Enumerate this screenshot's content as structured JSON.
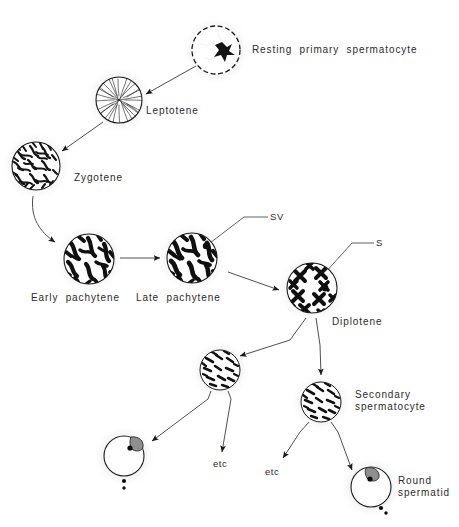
{
  "diagram": {
    "background_color": "#ffffff",
    "ink_color": "#1a1a1a",
    "text_color": "#2b2b2b",
    "halo_color": "#e8e8e8"
  },
  "labels": {
    "resting_primary_spermatocyte": "Resting  primary  spermatocyte",
    "leptotene": "Leptotene",
    "zygotene": "Zygotene",
    "early_pachytene": "Early  pachytene",
    "late_pachytene": "Late  pachytene",
    "diplotene": "Diplotene",
    "secondary_spermatocyte_line1": "Secondary",
    "secondary_spermatocyte_line2": "spermatocyte",
    "round_spermatid_line1": "Round",
    "round_spermatid_line2": "spermatid",
    "sv": "SV",
    "s": "S",
    "etc_left": "etc",
    "etc_right": "etc"
  },
  "cells": [
    {
      "id": "resting-primary-spermatocyte",
      "name": "resting-primary-spermatocyte-cell",
      "cx": 216,
      "cy": 50,
      "r": 25,
      "style": "dashed-outline-with-nucleolus"
    },
    {
      "id": "leptotene",
      "name": "leptotene-cell",
      "cx": 119,
      "cy": 100,
      "r": 24,
      "style": "fine-radiating-threads"
    },
    {
      "id": "zygotene",
      "name": "zygotene-cell",
      "cx": 36,
      "cy": 166,
      "r": 25,
      "style": "dense-squiggle-chromatin"
    },
    {
      "id": "early-pachytene",
      "name": "early-pachytene-cell",
      "cx": 89,
      "cy": 259,
      "r": 26,
      "style": "thick-chromosome-bars"
    },
    {
      "id": "late-pachytene",
      "name": "late-pachytene-cell",
      "cx": 192,
      "cy": 258,
      "r": 26,
      "style": "thick-chromosome-bars-with-sv"
    },
    {
      "id": "diplotene",
      "name": "diplotene-cell",
      "cx": 312,
      "cy": 288,
      "r": 26,
      "style": "bivalent-x-chromosomes-with-s"
    },
    {
      "id": "anaphase-cell",
      "name": "dividing-cell",
      "cx": 220,
      "cy": 370,
      "r": 21,
      "style": "scattered-chromosomes"
    },
    {
      "id": "secondary-spermatocyte",
      "name": "secondary-spermatocyte-cell",
      "cx": 321,
      "cy": 402,
      "r": 21,
      "style": "scattered-chromosomes"
    },
    {
      "id": "round-spermatid-left",
      "name": "round-spermatid-left-cell",
      "cx": 124,
      "cy": 456,
      "r": 21,
      "style": "spermatid-with-acrosome"
    },
    {
      "id": "round-spermatid-right",
      "name": "round-spermatid-right-cell",
      "cx": 371,
      "cy": 487,
      "r": 21,
      "style": "spermatid-with-acrosome"
    }
  ],
  "arrows": [
    {
      "name": "arrow-resting-to-leptotene",
      "from": "resting-primary-spermatocyte",
      "to": "leptotene"
    },
    {
      "name": "arrow-leptotene-to-zygotene",
      "from": "leptotene",
      "to": "zygotene"
    },
    {
      "name": "arrow-zygotene-to-early-pachytene",
      "from": "zygotene",
      "to": "early-pachytene"
    },
    {
      "name": "arrow-early-to-late-pachytene",
      "from": "early-pachytene",
      "to": "late-pachytene"
    },
    {
      "name": "arrow-late-pachytene-to-diplotene",
      "from": "late-pachytene",
      "to": "diplotene"
    },
    {
      "name": "arrow-diplotene-to-dividing-cell",
      "from": "diplotene",
      "to": "anaphase-cell"
    },
    {
      "name": "arrow-diplotene-to-secondary-spermatocyte",
      "from": "diplotene",
      "to": "secondary-spermatocyte"
    },
    {
      "name": "arrow-dividing-cell-to-spermatid-left",
      "from": "anaphase-cell",
      "to": "round-spermatid-left"
    },
    {
      "name": "arrow-dividing-cell-to-etc-left",
      "from": "anaphase-cell",
      "to": "etc_left"
    },
    {
      "name": "arrow-secondary-to-etc-right",
      "from": "secondary-spermatocyte",
      "to": "etc_right"
    },
    {
      "name": "arrow-secondary-to-spermatid-right",
      "from": "secondary-spermatocyte",
      "to": "round-spermatid-right"
    }
  ],
  "annotations": [
    {
      "name": "sv-leader-line",
      "label": "SV",
      "target": "late-pachytene"
    },
    {
      "name": "s-leader-line",
      "label": "S",
      "target": "diplotene"
    }
  ]
}
